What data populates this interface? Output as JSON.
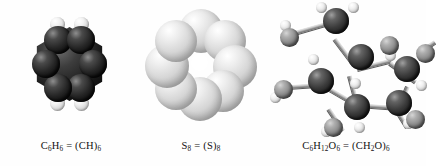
{
  "figure": {
    "background_color": "#fefefe",
    "type": "molecular-models-comparison",
    "panel_count": 3
  },
  "panels": [
    {
      "id": "benzene",
      "model_style": "space-filling",
      "caption": "C6H6 = (CH)6",
      "caption_parts": {
        "molecular_formula_element_1": "C",
        "molecular_formula_sub_1": "6",
        "molecular_formula_element_2": "H",
        "molecular_formula_sub_2": "6",
        "equals": "=",
        "empirical_open": "(",
        "empirical_body": "CH",
        "empirical_close": ")",
        "empirical_sub": "6"
      },
      "atoms": {
        "carbon_count": 6,
        "hydrogen_count": 6,
        "carbon_color": "#1c1c1c",
        "hydrogen_color": "#e6e6e6"
      },
      "geometry": "planar hexagonal ring"
    },
    {
      "id": "octasulfur",
      "model_style": "space-filling",
      "caption": "S8 = (S)8",
      "caption_parts": {
        "molecular_formula_element_1": "S",
        "molecular_formula_sub_1": "8",
        "equals": "=",
        "empirical_open": "(",
        "empirical_body": "S",
        "empirical_close": ")",
        "empirical_sub": "8"
      },
      "atoms": {
        "sulfur_count": 8,
        "sulfur_color": "#d2d2d2"
      },
      "geometry": "puckered crown ring with central hole"
    },
    {
      "id": "glucose",
      "model_style": "ball-and-stick",
      "caption": "C6H12O6 = (CH2O)6",
      "caption_parts": {
        "molecular_formula_element_1": "C",
        "molecular_formula_sub_1": "6",
        "molecular_formula_element_2": "H",
        "molecular_formula_sub_2": "12",
        "molecular_formula_element_3": "O",
        "molecular_formula_sub_3": "6",
        "equals": "=",
        "empirical_open": "(",
        "empirical_body_1": "CH",
        "empirical_body_sub": "2",
        "empirical_body_2": "O",
        "empirical_close": ")",
        "empirical_sub": "6"
      },
      "atoms": {
        "carbon_count": 6,
        "hydrogen_count": 12,
        "oxygen_count": 6,
        "carbon_color": "#2b2b2b",
        "oxygen_color": "#8a8a8a",
        "hydrogen_color": "#e4e4e4"
      },
      "geometry": "pyranose ring with substituents"
    }
  ]
}
